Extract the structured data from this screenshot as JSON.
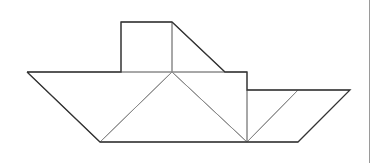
{
  "diagram": {
    "stroke_outline": "#333333",
    "stroke_inner": "#8a8a8a",
    "background": "#ffffff",
    "pieces": [
      {
        "name": "square",
        "points": [
          [
            121,
            22
          ],
          [
            172,
            22
          ],
          [
            172,
            72
          ],
          [
            121,
            72
          ]
        ],
        "kind": "outline"
      },
      {
        "name": "cabin-triangle",
        "points": [
          [
            172,
            22
          ],
          [
            225,
            72
          ],
          [
            172,
            72
          ]
        ],
        "kind": "outline"
      },
      {
        "name": "hull-left-triangle",
        "points": [
          [
            27,
            72
          ],
          [
            172,
            72
          ],
          [
            100,
            142
          ]
        ],
        "kind": "outline"
      },
      {
        "name": "hull-middle-triangle",
        "points": [
          [
            172,
            72
          ],
          [
            247,
            142
          ],
          [
            100,
            142
          ]
        ],
        "kind": "inner"
      },
      {
        "name": "hull-right-triangle",
        "points": [
          [
            172,
            72
          ],
          [
            247,
            72
          ],
          [
            247,
            142
          ]
        ],
        "kind": "inner"
      },
      {
        "name": "stern-triangle",
        "points": [
          [
            247,
            90
          ],
          [
            298,
            90
          ],
          [
            247,
            142
          ]
        ],
        "kind": "inner"
      },
      {
        "name": "parallelogram",
        "points": [
          [
            298,
            90
          ],
          [
            350,
            90
          ],
          [
            298,
            142
          ],
          [
            247,
            142
          ]
        ],
        "kind": "inner"
      }
    ],
    "outline_path": [
      [
        27,
        72
      ],
      [
        121,
        72
      ],
      [
        121,
        22
      ],
      [
        172,
        22
      ],
      [
        225,
        72
      ],
      [
        247,
        72
      ],
      [
        247,
        90
      ],
      [
        350,
        90
      ],
      [
        298,
        142
      ],
      [
        100,
        142
      ],
      [
        27,
        72
      ]
    ]
  }
}
